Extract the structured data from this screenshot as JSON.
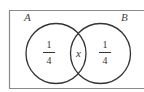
{
  "diagram": {
    "type": "venn",
    "universe": {
      "stroke": "#8a8a8a"
    },
    "sets": [
      {
        "name": "A",
        "label": "A",
        "only_region": {
          "numerator": "1",
          "denominator": "4"
        },
        "stroke": "#333333"
      },
      {
        "name": "B",
        "label": "B",
        "only_region": {
          "numerator": "1",
          "denominator": "4"
        },
        "stroke": "#333333"
      }
    ],
    "intersection": {
      "label": "x"
    }
  }
}
